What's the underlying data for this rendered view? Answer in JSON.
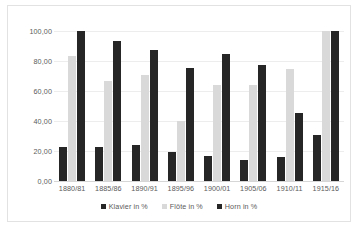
{
  "chart_data": {
    "type": "bar",
    "title": "",
    "subtitle": "",
    "xlabel": "",
    "ylabel": "",
    "ylim": [
      0,
      100
    ],
    "ytick_labels": [
      "100,00",
      "80,00",
      "60,00",
      "40,00",
      "20,00",
      "0,00"
    ],
    "ytick_values": [
      100,
      80,
      60,
      40,
      20,
      0
    ],
    "grid": true,
    "legend_position": "bottom",
    "categories": [
      "1880/81",
      "1885/86",
      "1890/91",
      "1895/96",
      "1900/01",
      "1905/06",
      "1910/11",
      "1915/16"
    ],
    "series": [
      {
        "name": "Klavier in %",
        "color": "#262626",
        "values": [
          22.5,
          23.0,
          23.8,
          19.4,
          17.0,
          14.0,
          16.0,
          30.8
        ]
      },
      {
        "name": "Flöte in %",
        "color": "#d9d9d9",
        "values": [
          83.5,
          66.8,
          70.4,
          40.2,
          64.0,
          63.8,
          75.0,
          100.0
        ]
      },
      {
        "name": "Horn in %",
        "color": "#262626",
        "values": [
          100.0,
          93.5,
          87.6,
          75.3,
          84.7,
          77.2,
          45.5,
          100.0
        ]
      }
    ]
  }
}
